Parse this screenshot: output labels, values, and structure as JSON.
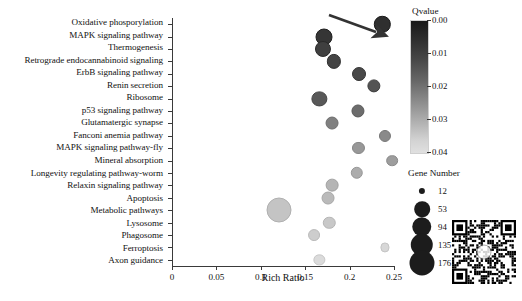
{
  "chart_data": {
    "type": "scatter",
    "title": "",
    "subtitle": "",
    "xlabel": "Rich Ratio",
    "ylabel": "",
    "xlim": [
      0,
      0.25
    ],
    "xticks": [
      0,
      0.05,
      0.1,
      0.15,
      0.2,
      0.25
    ],
    "xticklabels": [
      "0",
      "0.05",
      "0.1",
      "0.15",
      "0.2",
      "0.25"
    ],
    "grid": false,
    "categories": [
      "Oxidative phosporylation",
      "MAPK signaling pathway",
      "Thermogenesis",
      "Retrograde endocannabinoid signaling",
      "ErbB signaling pathway",
      "Renin secretion",
      "Ribosome",
      "p53 signaling pathway",
      "Glutamatergic synapse",
      "Fanconi anemia pathway",
      "MAPK signaling pathway-fly",
      "Mineral absorption",
      "Longevity regulating pathway-worm",
      "Relaxin signaling pathway",
      "Apoptosis",
      "Metabolic pathways",
      "Lysosome",
      "Phagosome",
      "Ferroptosis",
      "Axon guidance"
    ],
    "points": [
      {
        "pathway": "Oxidative phosporylation",
        "rich_ratio": 0.237,
        "qvalue": 0.004,
        "gene_number": 60
      },
      {
        "pathway": "MAPK signaling pathway",
        "rich_ratio": 0.171,
        "qvalue": 0.005,
        "gene_number": 66
      },
      {
        "pathway": "Thermogenesis",
        "rich_ratio": 0.17,
        "qvalue": 0.007,
        "gene_number": 57
      },
      {
        "pathway": "Retrograde endocannabinoid signaling",
        "rich_ratio": 0.182,
        "qvalue": 0.008,
        "gene_number": 42
      },
      {
        "pathway": "ErbB signaling pathway",
        "rich_ratio": 0.211,
        "qvalue": 0.009,
        "gene_number": 40
      },
      {
        "pathway": "Renin secretion",
        "rich_ratio": 0.227,
        "qvalue": 0.011,
        "gene_number": 35
      },
      {
        "pathway": "Ribosome",
        "rich_ratio": 0.166,
        "qvalue": 0.012,
        "gene_number": 50
      },
      {
        "pathway": "p53 signaling pathway",
        "rich_ratio": 0.209,
        "qvalue": 0.016,
        "gene_number": 34
      },
      {
        "pathway": "Glutamatergic synapse",
        "rich_ratio": 0.18,
        "qvalue": 0.02,
        "gene_number": 33
      },
      {
        "pathway": "Fanconi anemia pathway",
        "rich_ratio": 0.24,
        "qvalue": 0.022,
        "gene_number": 28
      },
      {
        "pathway": "MAPK signaling pathway-fly",
        "rich_ratio": 0.21,
        "qvalue": 0.025,
        "gene_number": 28
      },
      {
        "pathway": "Mineral absorption",
        "rich_ratio": 0.248,
        "qvalue": 0.026,
        "gene_number": 26
      },
      {
        "pathway": "Longevity regulating pathway-worm",
        "rich_ratio": 0.208,
        "qvalue": 0.029,
        "gene_number": 30
      },
      {
        "pathway": "Relaxin signaling pathway",
        "rich_ratio": 0.18,
        "qvalue": 0.031,
        "gene_number": 32
      },
      {
        "pathway": "Apoptosis",
        "rich_ratio": 0.176,
        "qvalue": 0.032,
        "gene_number": 33
      },
      {
        "pathway": "Metabolic pathways",
        "rich_ratio": 0.12,
        "qvalue": 0.034,
        "gene_number": 176
      },
      {
        "pathway": "Lysosome",
        "rich_ratio": 0.177,
        "qvalue": 0.035,
        "gene_number": 30
      },
      {
        "pathway": "Phagosome",
        "rich_ratio": 0.16,
        "qvalue": 0.036,
        "gene_number": 27
      },
      {
        "pathway": "Ferroptosis",
        "rich_ratio": 0.24,
        "qvalue": 0.038,
        "gene_number": 16
      },
      {
        "pathway": "Axon guidance",
        "rich_ratio": 0.166,
        "qvalue": 0.039,
        "gene_number": 24
      }
    ],
    "colorbar": {
      "title": "Qvalue",
      "ticks": [
        0.0,
        0.01,
        0.02,
        0.03,
        0.04
      ],
      "ticklabels": [
        "0.00",
        "0.01",
        "0.02",
        "0.03",
        "0.04"
      ],
      "min": 0.0,
      "max": 0.04,
      "color_min": "#191919",
      "color_max": "#e0e0e0"
    },
    "size_legend": {
      "title": "Gene Number",
      "values": [
        12,
        53,
        94,
        135,
        176
      ],
      "labels": [
        "12",
        "53",
        "94",
        "135",
        "176"
      ]
    },
    "annotations": [
      {
        "type": "arrow",
        "name": "highlight-arrow",
        "target": "Oxidative phosporylation"
      }
    ]
  },
  "decorations": {
    "qr_code_label": "qr-code"
  }
}
